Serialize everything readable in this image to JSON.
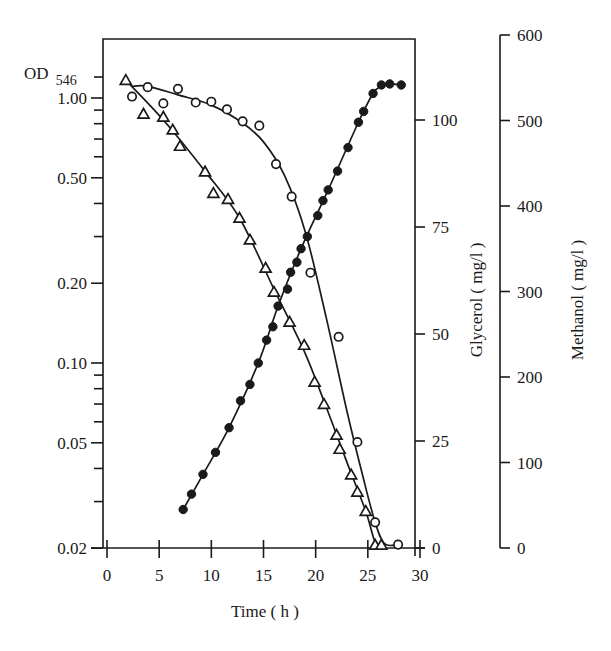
{
  "chart_data": {
    "type": "scatter",
    "title": "",
    "xlabel": "Time ( h )",
    "x_ticks": [
      0,
      5,
      10,
      15,
      20,
      25,
      30
    ],
    "xlim": [
      0,
      30
    ],
    "axes": {
      "left": {
        "label": "OD",
        "label_subscript": "546",
        "scale": "log",
        "lim": [
          0.02,
          1.3
        ],
        "ticks": [
          {
            "value": 1.0,
            "label": "1.00"
          },
          {
            "value": 0.5,
            "label": "0.50"
          },
          {
            "value": 0.2,
            "label": "0.20"
          },
          {
            "value": 0.1,
            "label": "0.10"
          },
          {
            "value": 0.05,
            "label": "0.05"
          },
          {
            "value": 0.02,
            "label": "0.02"
          }
        ],
        "minor_ticks": [
          1.2,
          0.9,
          0.8,
          0.7,
          0.6,
          0.4,
          0.3,
          0.09,
          0.08,
          0.07,
          0.06,
          0.04,
          0.03
        ]
      },
      "glycerol": {
        "label": "Glycerol ( mg/l )",
        "scale": "linear",
        "lim": [
          0,
          122
        ],
        "ticks": [
          0,
          25,
          50,
          75,
          100
        ]
      },
      "methanol": {
        "label": "Methanol ( mg/l )",
        "scale": "linear",
        "lim": [
          0,
          600
        ],
        "ticks": [
          0,
          100,
          200,
          300,
          400,
          500,
          600
        ]
      }
    },
    "series": [
      {
        "name": "OD546",
        "marker": "filled-circle",
        "axis": "left",
        "x": [
          7.3,
          8.1,
          9.2,
          10.4,
          11.7,
          12.8,
          13.7,
          14.5,
          15.3,
          15.9,
          16.4,
          17.3,
          17.6,
          18.2,
          18.6,
          19.2,
          20.2,
          20.7,
          21.2,
          22.1,
          23.1,
          24.1,
          24.6,
          25.5,
          26.3,
          27.1,
          28.2
        ],
        "y": [
          0.028,
          0.032,
          0.038,
          0.046,
          0.057,
          0.072,
          0.083,
          0.1,
          0.122,
          0.137,
          0.164,
          0.19,
          0.22,
          0.24,
          0.27,
          0.3,
          0.36,
          0.41,
          0.45,
          0.53,
          0.65,
          0.81,
          0.89,
          1.04,
          1.12,
          1.13,
          1.12
        ]
      },
      {
        "name": "Glycerol",
        "marker": "open-triangle",
        "axis": "glycerol",
        "x": [
          1.8,
          3.5,
          5.4,
          6.3,
          7.0,
          9.4,
          10.2,
          11.6,
          12.7,
          13.7,
          15.2,
          16.0,
          17.5,
          18.9,
          19.9,
          20.8,
          22.0,
          22.3,
          23.4,
          24.0,
          24.8,
          25.7,
          26.3
        ],
        "y": [
          109.3,
          101.4,
          100.7,
          97.7,
          93.9,
          87.9,
          82.9,
          81.5,
          77.1,
          72.0,
          65.4,
          59.8,
          52.8,
          47.4,
          38.8,
          33.6,
          26.4,
          23.1,
          17.1,
          13.1,
          8.6,
          0.7,
          0.7
        ]
      },
      {
        "name": "Methanol",
        "marker": "open-circle",
        "axis": "methanol",
        "x": [
          2.4,
          3.9,
          5.4,
          6.8,
          8.5,
          10.0,
          11.5,
          13.0,
          14.6,
          16.2,
          17.7,
          19.5,
          22.2,
          24.0,
          25.7,
          27.9
        ],
        "y": [
          528,
          539,
          520,
          537,
          521,
          522,
          513,
          499,
          494,
          449,
          411,
          322,
          247,
          124,
          30,
          4
        ]
      }
    ],
    "fit_curves": [
      {
        "series": "OD546",
        "x": [
          7.3,
          9.2,
          11.7,
          14.5,
          16.4,
          18.6,
          21.2,
          24.1,
          25.5,
          26.3,
          27.1,
          28.2
        ],
        "y": [
          0.028,
          0.038,
          0.057,
          0.1,
          0.164,
          0.27,
          0.45,
          0.81,
          1.04,
          1.11,
          1.13,
          1.12
        ]
      },
      {
        "series": "Glycerol",
        "x": [
          1.8,
          5.4,
          9.4,
          12.7,
          16.0,
          18.9,
          21.0,
          23.0,
          24.8,
          25.6,
          26.2
        ],
        "y": [
          109.3,
          100.0,
          88.0,
          77.1,
          60.5,
          46.0,
          33.0,
          20.0,
          8.6,
          2.0,
          0
        ]
      },
      {
        "series": "Methanol",
        "x": [
          2.4,
          3.9,
          6.8,
          10.0,
          13.0,
          15.0,
          17.0,
          19.0,
          21.0,
          23.0,
          24.5,
          25.7,
          26.6,
          27.9
        ],
        "y": [
          540,
          540,
          530,
          518,
          497,
          475,
          436,
          370,
          270,
          160,
          85,
          30,
          5,
          4
        ]
      }
    ],
    "grid": false,
    "legend": "none"
  }
}
